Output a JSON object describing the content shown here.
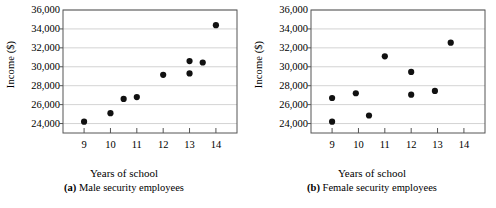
{
  "figure": {
    "background_color": "#ffffff",
    "axis_color": "#555555",
    "grid_color": "#c8c8c8",
    "point_color": "#111111"
  },
  "panels": [
    {
      "key": "panel_a",
      "caption_prefix": "(a)",
      "caption_text": "Male security employees",
      "caption_full": "(a) Male security employees"
    },
    {
      "key": "panel_b",
      "caption_prefix": "(b)",
      "caption_text": "Female security employees",
      "caption_full": "(b) Female security employees"
    }
  ],
  "chart_data": [
    {
      "type": "scatter",
      "title": "(a) Male security employees",
      "xlabel": "Years of school",
      "ylabel": "Income ($)",
      "xlim": [
        8.2,
        14.8
      ],
      "ylim": [
        23000,
        36000
      ],
      "xticks": [
        9,
        10,
        11,
        12,
        13,
        14
      ],
      "xtick_labels": [
        "9",
        "10",
        "11",
        "12",
        "13",
        "14"
      ],
      "yticks": [
        24000,
        26000,
        28000,
        30000,
        32000,
        34000,
        36000
      ],
      "ytick_labels": [
        "24,000",
        "26,000",
        "28,000",
        "30,000",
        "32,000",
        "34,000",
        "36,000"
      ],
      "grid": true,
      "grid_axis": "y",
      "legend": "none",
      "x": [
        9,
        10,
        10.5,
        11,
        12,
        13,
        13,
        13.5,
        14
      ],
      "y": [
        24200,
        25100,
        26600,
        26800,
        29150,
        29300,
        30600,
        30450,
        34400
      ]
    },
    {
      "type": "scatter",
      "title": "(b) Female security employees",
      "xlabel": "Years of school",
      "ylabel": "Income ($)",
      "xlim": [
        8.2,
        14.8
      ],
      "ylim": [
        23000,
        36000
      ],
      "xticks": [
        9,
        10,
        11,
        12,
        13,
        14
      ],
      "xtick_labels": [
        "9",
        "10",
        "11",
        "12",
        "13",
        "14"
      ],
      "yticks": [
        24000,
        26000,
        28000,
        30000,
        32000,
        34000,
        36000
      ],
      "ytick_labels": [
        "24,000",
        "26,000",
        "28,000",
        "30,000",
        "32,000",
        "34,000",
        "36,000"
      ],
      "grid": true,
      "grid_axis": "y",
      "legend": "none",
      "x": [
        9,
        9,
        9.9,
        10.4,
        11,
        12,
        12,
        12.9,
        13.5
      ],
      "y": [
        24200,
        26700,
        27200,
        24850,
        31100,
        27050,
        29450,
        27450,
        32550
      ]
    }
  ]
}
